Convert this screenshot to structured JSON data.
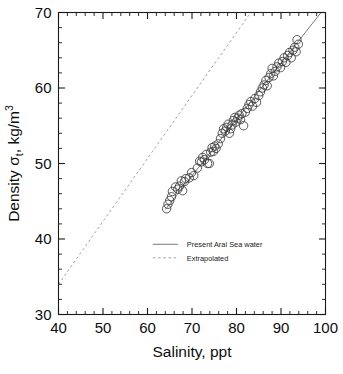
{
  "chart_data": {
    "type": "scatter",
    "title": "",
    "xlabel": "Salinity, ppt",
    "ylabel": "Density σt, kg/m3",
    "ylabel_parts": {
      "prefix": "Density ",
      "sigma": "σ",
      "subscript": "t",
      "middle": ", kg/m",
      "superscript": "3"
    },
    "xlim": [
      40,
      100
    ],
    "ylim": [
      30,
      70
    ],
    "xticks": [
      40,
      50,
      60,
      70,
      80,
      90,
      100
    ],
    "yticks": [
      30,
      40,
      50,
      60,
      70
    ],
    "xtick_labels": [
      "40",
      "50",
      "60",
      "70",
      "80",
      "90",
      "100"
    ],
    "ytick_labels": [
      "30",
      "40",
      "50",
      "60",
      "70"
    ],
    "x_minor_step": 2,
    "y_minor_step": 2,
    "grid": false,
    "legend_position": "inside-lower-center",
    "marker_style": "open-circle",
    "marker_radius_px": 4.2,
    "colors": {
      "axis": "#1a1a1a",
      "marker_edge": "#3c3c3c",
      "solid_line": "#555555",
      "dashed_line": "#8c8c8c",
      "text": "#0d0d0d",
      "background": "#ffffff"
    },
    "legend": [
      {
        "label": "Present Aral Sea water",
        "style": "solid",
        "color": "#555555"
      },
      {
        "label": "Extrapolated",
        "style": "dashed",
        "color": "#8c8c8c"
      }
    ],
    "series": [
      {
        "name": "Present Aral Sea water",
        "type": "line",
        "style": "solid",
        "points": [
          [
            64.0,
            43.9
          ],
          [
            99.0,
            70.0
          ]
        ]
      },
      {
        "name": "Extrapolated",
        "type": "line",
        "style": "dashed",
        "points": [
          [
            40.0,
            34.0
          ],
          [
            83.2,
            70.0
          ]
        ]
      },
      {
        "name": "Measurements",
        "type": "scatter",
        "points": [
          [
            64.3,
            44.0
          ],
          [
            64.6,
            44.6
          ],
          [
            65.0,
            45.1
          ],
          [
            65.4,
            45.6
          ],
          [
            65.6,
            46.3
          ],
          [
            66.3,
            46.9
          ],
          [
            66.8,
            46.6
          ],
          [
            67.2,
            47.0
          ],
          [
            67.6,
            47.7
          ],
          [
            67.9,
            46.4
          ],
          [
            68.3,
            47.6
          ],
          [
            68.6,
            48.0
          ],
          [
            69.4,
            48.1
          ],
          [
            69.9,
            48.8
          ],
          [
            70.4,
            48.4
          ],
          [
            71.2,
            49.4
          ],
          [
            71.7,
            50.3
          ],
          [
            72.1,
            50.2
          ],
          [
            72.4,
            50.8
          ],
          [
            72.8,
            50.5
          ],
          [
            73.2,
            51.2
          ],
          [
            73.5,
            50.0
          ],
          [
            73.9,
            50.0
          ],
          [
            74.2,
            51.5
          ],
          [
            74.5,
            52.1
          ],
          [
            74.8,
            51.6
          ],
          [
            75.1,
            52.3
          ],
          [
            75.4,
            52.0
          ],
          [
            75.9,
            52.6
          ],
          [
            76.4,
            53.3
          ],
          [
            76.8,
            54.0
          ],
          [
            77.1,
            54.6
          ],
          [
            77.5,
            54.3
          ],
          [
            77.8,
            54.8
          ],
          [
            78.1,
            55.2
          ],
          [
            78.4,
            54.0
          ],
          [
            78.7,
            54.6
          ],
          [
            79.0,
            55.1
          ],
          [
            79.3,
            55.7
          ],
          [
            79.6,
            56.1
          ],
          [
            79.9,
            55.5
          ],
          [
            80.3,
            56.0
          ],
          [
            80.6,
            56.4
          ],
          [
            80.9,
            55.8
          ],
          [
            81.2,
            56.6
          ],
          [
            81.6,
            55.0
          ],
          [
            82.0,
            56.8
          ],
          [
            82.4,
            57.3
          ],
          [
            82.8,
            57.8
          ],
          [
            83.2,
            58.2
          ],
          [
            83.6,
            57.6
          ],
          [
            84.1,
            58.6
          ],
          [
            84.5,
            58.1
          ],
          [
            85.0,
            59.0
          ],
          [
            85.4,
            59.5
          ],
          [
            85.8,
            60.0
          ],
          [
            86.2,
            60.4
          ],
          [
            86.6,
            61.0
          ],
          [
            86.9,
            60.3
          ],
          [
            87.3,
            61.4
          ],
          [
            87.7,
            61.9
          ],
          [
            88.0,
            62.6
          ],
          [
            88.3,
            61.6
          ],
          [
            88.7,
            62.2
          ],
          [
            89.1,
            62.8
          ],
          [
            89.5,
            63.3
          ],
          [
            89.9,
            62.7
          ],
          [
            90.3,
            63.5
          ],
          [
            90.7,
            64.0
          ],
          [
            91.1,
            63.4
          ],
          [
            91.5,
            64.3
          ],
          [
            91.9,
            64.7
          ],
          [
            92.3,
            64.0
          ],
          [
            92.7,
            65.0
          ],
          [
            93.1,
            65.4
          ],
          [
            93.4,
            64.8
          ],
          [
            93.6,
            66.4
          ],
          [
            93.9,
            65.8
          ]
        ]
      }
    ]
  }
}
